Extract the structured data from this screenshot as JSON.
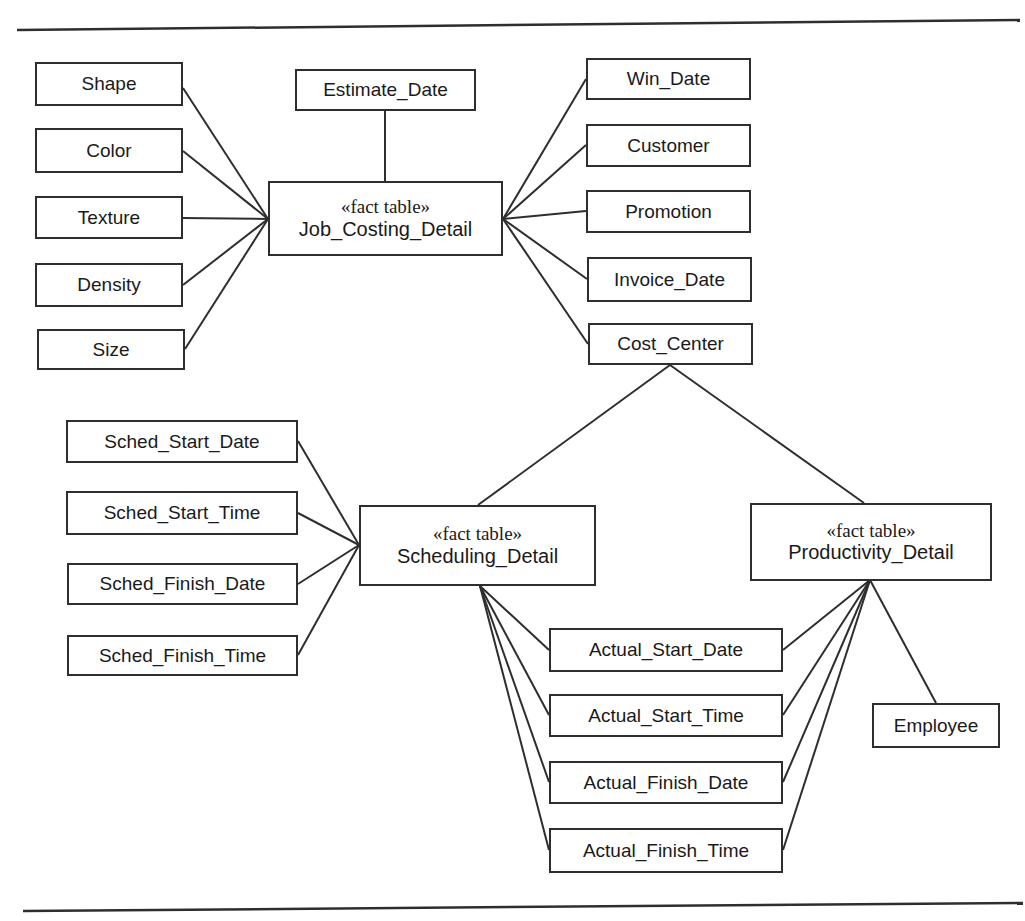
{
  "diagram": {
    "type": "dimensional-model",
    "colors": {
      "background": "#ffffff",
      "line": "#2e2e2e",
      "text": "#1a1a1a"
    },
    "nodes": {
      "shape": {
        "label": "Shape"
      },
      "color": {
        "label": "Color"
      },
      "texture": {
        "label": "Texture"
      },
      "density": {
        "label": "Density"
      },
      "size": {
        "label": "Size"
      },
      "estimate_date": {
        "label": "Estimate_Date"
      },
      "win_date": {
        "label": "Win_Date"
      },
      "customer": {
        "label": "Customer"
      },
      "promotion": {
        "label": "Promotion"
      },
      "invoice_date": {
        "label": "Invoice_Date"
      },
      "cost_center": {
        "label": "Cost_Center"
      },
      "sched_start_date": {
        "label": "Sched_Start_Date"
      },
      "sched_start_time": {
        "label": "Sched_Start_Time"
      },
      "sched_finish_date": {
        "label": "Sched_Finish_Date"
      },
      "sched_finish_time": {
        "label": "Sched_Finish_Time"
      },
      "actual_start_date": {
        "label": "Actual_Start_Date"
      },
      "actual_start_time": {
        "label": "Actual_Start_Time"
      },
      "actual_finish_date": {
        "label": "Actual_Finish_Date"
      },
      "actual_finish_time": {
        "label": "Actual_Finish_Time"
      },
      "employee": {
        "label": "Employee"
      },
      "job_costing": {
        "stereotype": "«fact table»",
        "name": "Job_Costing_Detail"
      },
      "scheduling": {
        "stereotype": "«fact table»",
        "name": "Scheduling_Detail"
      },
      "productivity": {
        "stereotype": "«fact table»",
        "name": "Productivity_Detail"
      }
    },
    "connections": [
      {
        "from": "shape",
        "to": "job_costing"
      },
      {
        "from": "color",
        "to": "job_costing"
      },
      {
        "from": "texture",
        "to": "job_costing"
      },
      {
        "from": "density",
        "to": "job_costing"
      },
      {
        "from": "size",
        "to": "job_costing"
      },
      {
        "from": "estimate_date",
        "to": "job_costing"
      },
      {
        "from": "win_date",
        "to": "job_costing"
      },
      {
        "from": "customer",
        "to": "job_costing"
      },
      {
        "from": "promotion",
        "to": "job_costing"
      },
      {
        "from": "invoice_date",
        "to": "job_costing"
      },
      {
        "from": "cost_center",
        "to": "job_costing"
      },
      {
        "from": "cost_center",
        "to": "scheduling"
      },
      {
        "from": "cost_center",
        "to": "productivity"
      },
      {
        "from": "sched_start_date",
        "to": "scheduling"
      },
      {
        "from": "sched_start_time",
        "to": "scheduling"
      },
      {
        "from": "sched_finish_date",
        "to": "scheduling"
      },
      {
        "from": "sched_finish_time",
        "to": "scheduling"
      },
      {
        "from": "actual_start_date",
        "to": "scheduling"
      },
      {
        "from": "actual_start_time",
        "to": "scheduling"
      },
      {
        "from": "actual_finish_date",
        "to": "scheduling"
      },
      {
        "from": "actual_finish_time",
        "to": "scheduling"
      },
      {
        "from": "actual_start_date",
        "to": "productivity"
      },
      {
        "from": "actual_start_time",
        "to": "productivity"
      },
      {
        "from": "actual_finish_date",
        "to": "productivity"
      },
      {
        "from": "actual_finish_time",
        "to": "productivity"
      },
      {
        "from": "employee",
        "to": "productivity"
      }
    ]
  }
}
